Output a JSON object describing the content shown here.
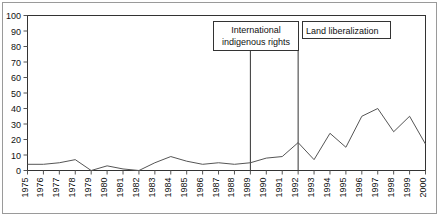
{
  "chart_data": {
    "type": "line",
    "title": "",
    "subtitle": "",
    "xlabel": "",
    "ylabel": "",
    "grid": false,
    "legend": "none",
    "xlim": [
      1975,
      2000
    ],
    "ylim": [
      0,
      100
    ],
    "ytick_labels": [
      "0",
      "10",
      "20",
      "30",
      "40",
      "50",
      "60",
      "70",
      "80",
      "90",
      "100"
    ],
    "ytick_values": [
      0,
      10,
      20,
      30,
      40,
      50,
      60,
      70,
      80,
      90,
      100
    ],
    "categories": [
      "1975",
      "1976",
      "1977",
      "1978",
      "1979",
      "1980",
      "1981",
      "1982",
      "1983",
      "1984",
      "1985",
      "1986",
      "1987",
      "1988",
      "1989",
      "1990",
      "1991",
      "1992",
      "1993",
      "1994",
      "1995",
      "1996",
      "1997",
      "1998",
      "1999",
      "2000"
    ],
    "x": [
      1975,
      1976,
      1977,
      1978,
      1979,
      1980,
      1981,
      1982,
      1983,
      1984,
      1985,
      1986,
      1987,
      1988,
      1989,
      1990,
      1991,
      1992,
      1993,
      1994,
      1995,
      1996,
      1997,
      1998,
      1999,
      2000
    ],
    "values": [
      4,
      4,
      5,
      7,
      0,
      3,
      1,
      0,
      5,
      9,
      6,
      4,
      5,
      4,
      5,
      8,
      9,
      18,
      7,
      24,
      15,
      35,
      40,
      25,
      35,
      17
    ],
    "series": [
      {
        "name": "",
        "color": "#555555",
        "values": [
          4,
          4,
          5,
          7,
          0,
          3,
          1,
          0,
          5,
          9,
          6,
          4,
          5,
          4,
          5,
          8,
          9,
          18,
          7,
          24,
          15,
          35,
          40,
          25,
          35,
          17
        ]
      }
    ],
    "annotations": [
      {
        "id": "international-indigenous-rights",
        "lines": [
          "International",
          "indigenous rights"
        ],
        "text": "International indigenous rights",
        "marker_year": 1989
      },
      {
        "id": "land-liberalization",
        "lines": [
          "Land liberalization"
        ],
        "text": "Land liberalization",
        "marker_year": 1992
      }
    ]
  },
  "colors": {
    "line": "#555555",
    "axis": "#333333",
    "annotation_line": "#333333",
    "frame": "#9a9a9a",
    "text": "#111111",
    "background": "#ffffff"
  }
}
